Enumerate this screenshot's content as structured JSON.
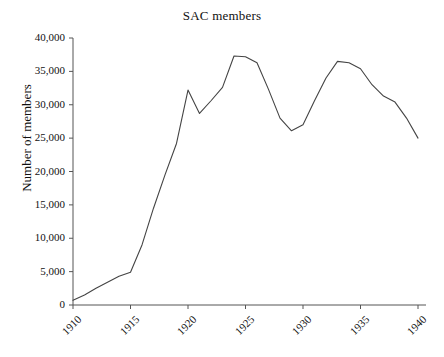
{
  "chart_data": {
    "type": "line",
    "title": "SAC members",
    "xlabel": "",
    "ylabel": "Number of members",
    "xlim": [
      1910,
      1940
    ],
    "ylim": [
      0,
      40000
    ],
    "grid": false,
    "legend": null,
    "x_ticks": [
      "1910",
      "1915",
      "1920",
      "1925",
      "1930",
      "1935",
      "1940"
    ],
    "x_tick_values": [
      1910,
      1915,
      1920,
      1925,
      1930,
      1935,
      1940
    ],
    "y_ticks": [
      "0",
      "5,000",
      "10,000",
      "15,000",
      "20,000",
      "25,000",
      "30,000",
      "35,000",
      "40,000"
    ],
    "y_tick_values": [
      0,
      5000,
      10000,
      15000,
      20000,
      25000,
      30000,
      35000,
      40000
    ],
    "line_color": "#444444",
    "series": [
      {
        "name": "SAC members",
        "x": [
          1910,
          1911,
          1912,
          1913,
          1914,
          1915,
          1916,
          1917,
          1918,
          1919,
          1920,
          1921,
          1922,
          1923,
          1924,
          1925,
          1926,
          1927,
          1928,
          1929,
          1930,
          1931,
          1932,
          1933,
          1934,
          1935,
          1936,
          1937,
          1938,
          1939,
          1940
        ],
        "values": [
          700,
          1500,
          2500,
          3400,
          4300,
          4900,
          9000,
          14500,
          19500,
          24200,
          32200,
          28700,
          30600,
          32600,
          37300,
          37200,
          36300,
          32300,
          28000,
          26100,
          27000,
          30600,
          34000,
          36500,
          36300,
          35400,
          33000,
          31300,
          30400,
          28000,
          25000
        ]
      }
    ]
  }
}
